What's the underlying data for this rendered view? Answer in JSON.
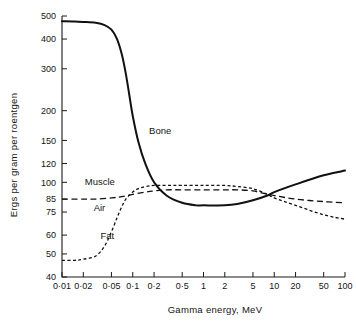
{
  "chart_data": {
    "type": "line",
    "title": "",
    "xlabel": "Gamma energy,   MeV",
    "ylabel": "Ergs  per  gram   per  roentgen",
    "xscale": "log",
    "yscale": "log",
    "xlim": [
      0.01,
      100
    ],
    "ylim": [
      40,
      500
    ],
    "grid": false,
    "legend_position": "inline-labels",
    "xticks": [
      "0·01",
      "0·02",
      "0·05",
      "0·1",
      "0·2",
      "0·5",
      "1",
      "2",
      "5",
      "10",
      "20",
      "50",
      "100"
    ],
    "xtick_values": [
      0.01,
      0.02,
      0.05,
      0.1,
      0.2,
      0.5,
      1,
      2,
      5,
      10,
      20,
      50,
      100
    ],
    "yticks": [
      "500",
      "400",
      "300",
      "200",
      "150",
      "120",
      "100",
      "85",
      "75",
      "60",
      "50",
      "40"
    ],
    "ytick_values": [
      500,
      400,
      300,
      200,
      150,
      120,
      100,
      85,
      75,
      60,
      50,
      40
    ],
    "series": [
      {
        "name": "Bone",
        "style": "solid",
        "label": "Bone",
        "x": [
          0.01,
          0.015,
          0.02,
          0.03,
          0.04,
          0.05,
          0.06,
          0.07,
          0.08,
          0.09,
          0.1,
          0.12,
          0.15,
          0.2,
          0.3,
          0.5,
          0.8,
          1,
          2,
          3,
          5,
          8,
          10,
          20,
          50,
          100
        ],
        "values": [
          475,
          474,
          472,
          468,
          458,
          438,
          400,
          345,
          285,
          230,
          190,
          148,
          120,
          100,
          88,
          82,
          80,
          80,
          80,
          81,
          84,
          88,
          91,
          98,
          107,
          112
        ]
      },
      {
        "name": "Muscle",
        "style": "long-dash",
        "label": "Muscle",
        "x": [
          0.01,
          0.02,
          0.03,
          0.05,
          0.07,
          0.1,
          0.15,
          0.2,
          0.3,
          0.5,
          1,
          2,
          3,
          5,
          8,
          10,
          20,
          50,
          100
        ],
        "values": [
          85,
          85,
          85,
          86,
          87,
          89,
          91,
          92,
          93,
          93,
          93,
          93,
          93,
          92,
          89,
          88,
          85,
          83,
          82
        ]
      },
      {
        "name": "Fat",
        "style": "short-dash",
        "label": "Fat",
        "x": [
          0.01,
          0.015,
          0.02,
          0.03,
          0.04,
          0.05,
          0.06,
          0.07,
          0.08,
          0.1,
          0.12,
          0.15,
          0.2,
          0.3,
          0.5,
          1,
          2,
          3,
          5,
          8,
          10,
          20,
          50,
          100
        ],
        "values": [
          47,
          47,
          47.5,
          49,
          54,
          62,
          71,
          79,
          85,
          91,
          94,
          96,
          97,
          97,
          97,
          97,
          97,
          96,
          94,
          89,
          86,
          80,
          73,
          70
        ]
      }
    ],
    "annotations": [
      {
        "text": "Bone",
        "x": 0.17,
        "y": 160
      },
      {
        "text": "Muscle",
        "x": 0.021,
        "y": 97
      },
      {
        "text": "Air",
        "x": 0.028,
        "y": 76
      },
      {
        "text": "Fat",
        "x": 0.035,
        "y": 58
      }
    ]
  }
}
